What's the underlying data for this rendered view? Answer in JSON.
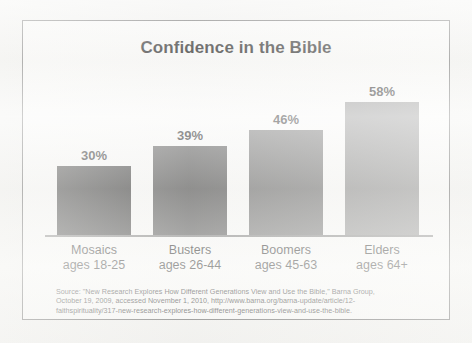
{
  "chart_data": {
    "type": "bar",
    "title": "Confidence in the Bible",
    "xlabel": "",
    "ylabel": "",
    "ylim": [
      0,
      65
    ],
    "grid": false,
    "legend": "none",
    "categories": [
      "Mosaics",
      "Busters",
      "Boomers",
      "Elders"
    ],
    "category_sublabels": [
      "ages 18-25",
      "ages 26-44",
      "ages 45-63",
      "ages 64+"
    ],
    "values": [
      30,
      39,
      46,
      58
    ],
    "value_labels": [
      "30%",
      "39%",
      "46%",
      "58%"
    ],
    "bar_colors": [
      "#3a3a3a",
      "#555555",
      "#6e6e6e",
      "#8a8a8a"
    ],
    "points": [
      {
        "category": "Mosaics",
        "sublabel": "ages 18-25",
        "value": 30,
        "label": "30%",
        "color": "#3a3a3a"
      },
      {
        "category": "Busters",
        "sublabel": "ages 26-44",
        "value": 39,
        "label": "39%",
        "color": "#555555"
      },
      {
        "category": "Boomers",
        "sublabel": "ages 45-63",
        "value": 46,
        "label": "46%",
        "color": "#6e6e6e"
      },
      {
        "category": "Elders",
        "sublabel": "ages 64+",
        "value": 58,
        "label": "58%",
        "color": "#8a8a8a"
      }
    ]
  },
  "source": {
    "line1": "Source: \"New Research Explores How Different Generations View and Use the Bible,\" Barna Group,",
    "line2": "October 19, 2009, accessed November 1, 2010, http://www.barna.org/barna-update/article/12-",
    "line3": "faithspirituality/317-new-research-explores-how-different-generations-view-and-use-the-bible."
  }
}
